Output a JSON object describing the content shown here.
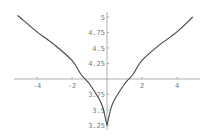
{
  "chart_data": {
    "type": "line",
    "title": "",
    "xlabel": "",
    "ylabel": "",
    "xlim": [
      -5.1,
      5.0
    ],
    "ylim": [
      3.25,
      5.0
    ],
    "axes_cross": {
      "x": 0,
      "y": 4.0
    },
    "grid": false,
    "legend": null,
    "x_ticks": [
      -4,
      -2,
      2,
      4
    ],
    "x_tick_labels": [
      "-4",
      "-2",
      "2",
      "4"
    ],
    "y_ticks": [
      5,
      4.75,
      4.5,
      4.25,
      3.75,
      3.5,
      3.25
    ],
    "y_tick_labels": [
      "5",
      "4.75",
      "4.5",
      "4.25",
      "3.75",
      "3.5",
      "3.25"
    ],
    "series": [
      {
        "name": "f(x)",
        "color": "#444444",
        "x": [
          -5.1,
          -5,
          -4,
          -3,
          -2,
          -1.5,
          -1.25,
          -1,
          -0.5,
          -0.25,
          0,
          0.25,
          0.5,
          1,
          1.25,
          1.5,
          2,
          3,
          4,
          4.9
        ],
        "y": [
          5.02,
          5.0,
          4.76,
          4.55,
          4.3,
          4.08,
          4.0,
          3.92,
          3.7,
          3.55,
          3.25,
          3.55,
          3.7,
          3.92,
          4.0,
          4.08,
          4.3,
          4.55,
          4.76,
          5.0
        ]
      }
    ]
  },
  "plot_area": {
    "origin_px": {
      "x": 107,
      "y": 79
    },
    "px_per_x_unit": 17.5,
    "px_per_y_unit": 62,
    "x_axis_extent_px": [
      14,
      200
    ],
    "y_axis_extent_px": [
      12,
      130
    ]
  }
}
